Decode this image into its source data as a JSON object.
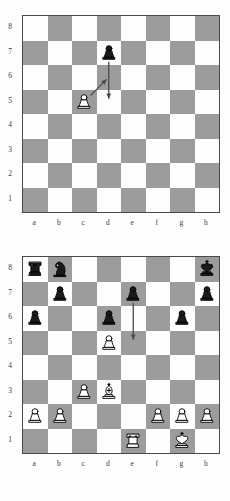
{
  "colors": {
    "light_square": "#fdfdfd",
    "dark_square": "#9c9c9c",
    "border": "#4a4a4a",
    "label_text": "#3b3b3b",
    "arrow": "#4a4a4a",
    "white_piece_fill": "#ffffff",
    "black_piece_fill": "#1a1a1a",
    "piece_outline": "#000000"
  },
  "files": [
    "a",
    "b",
    "c",
    "d",
    "e",
    "f",
    "g",
    "h"
  ],
  "ranks": [
    "8",
    "7",
    "6",
    "5",
    "4",
    "3",
    "2",
    "1"
  ],
  "diagrams": [
    {
      "id": "diagram-1",
      "caption": "",
      "pieces": [
        {
          "square": "d7",
          "file": "d",
          "rank": "7",
          "color": "black",
          "type": "pawn",
          "glyph": "♟"
        },
        {
          "square": "c5",
          "file": "c",
          "rank": "5",
          "color": "white",
          "type": "pawn",
          "glyph": "♙"
        }
      ],
      "arrows": [
        {
          "from": "d7",
          "to": "d5",
          "style": "straight",
          "label": "black-pawn-double-advance"
        },
        {
          "from": "c5",
          "to": "d6",
          "style": "straight",
          "label": "white-pawn-en-passant-capture"
        }
      ]
    },
    {
      "id": "diagram-2",
      "caption": "",
      "pieces": [
        {
          "square": "a8",
          "file": "a",
          "rank": "8",
          "color": "black",
          "type": "rook",
          "glyph": "♜"
        },
        {
          "square": "b8",
          "file": "b",
          "rank": "8",
          "color": "black",
          "type": "knight",
          "glyph": "♞"
        },
        {
          "square": "h8",
          "file": "h",
          "rank": "8",
          "color": "black",
          "type": "king",
          "glyph": "♚"
        },
        {
          "square": "b7",
          "file": "b",
          "rank": "7",
          "color": "black",
          "type": "pawn",
          "glyph": "♟"
        },
        {
          "square": "e7",
          "file": "e",
          "rank": "7",
          "color": "black",
          "type": "pawn",
          "glyph": "♟"
        },
        {
          "square": "h7",
          "file": "h",
          "rank": "7",
          "color": "black",
          "type": "pawn",
          "glyph": "♟"
        },
        {
          "square": "a6",
          "file": "a",
          "rank": "6",
          "color": "black",
          "type": "pawn",
          "glyph": "♟"
        },
        {
          "square": "d6",
          "file": "d",
          "rank": "6",
          "color": "black",
          "type": "pawn",
          "glyph": "♟"
        },
        {
          "square": "g6",
          "file": "g",
          "rank": "6",
          "color": "black",
          "type": "pawn",
          "glyph": "♟"
        },
        {
          "square": "d5",
          "file": "d",
          "rank": "5",
          "color": "white",
          "type": "pawn",
          "glyph": "♙"
        },
        {
          "square": "c3",
          "file": "c",
          "rank": "3",
          "color": "white",
          "type": "pawn",
          "glyph": "♙"
        },
        {
          "square": "d3",
          "file": "d",
          "rank": "3",
          "color": "white",
          "type": "bishop",
          "glyph": "♗"
        },
        {
          "square": "a2",
          "file": "a",
          "rank": "2",
          "color": "white",
          "type": "pawn",
          "glyph": "♙"
        },
        {
          "square": "b2",
          "file": "b",
          "rank": "2",
          "color": "white",
          "type": "pawn",
          "glyph": "♙"
        },
        {
          "square": "f2",
          "file": "f",
          "rank": "2",
          "color": "white",
          "type": "pawn",
          "glyph": "♙"
        },
        {
          "square": "g2",
          "file": "g",
          "rank": "2",
          "color": "white",
          "type": "pawn",
          "glyph": "♙"
        },
        {
          "square": "h2",
          "file": "h",
          "rank": "2",
          "color": "white",
          "type": "pawn",
          "glyph": "♙"
        },
        {
          "square": "e1",
          "file": "e",
          "rank": "1",
          "color": "white",
          "type": "rook",
          "glyph": "♖"
        },
        {
          "square": "g1",
          "file": "g",
          "rank": "1",
          "color": "white",
          "type": "king",
          "glyph": "♔"
        }
      ],
      "arrows": [
        {
          "from": "e7",
          "to": "e5",
          "style": "straight",
          "label": "black-pawn-double-advance"
        }
      ]
    }
  ]
}
